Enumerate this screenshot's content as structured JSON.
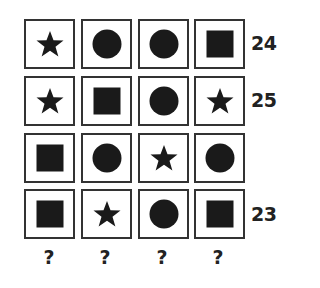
{
  "puzzle": {
    "grid": [
      [
        "star",
        "circle",
        "circle",
        "square"
      ],
      [
        "star",
        "square",
        "circle",
        "star"
      ],
      [
        "square",
        "circle",
        "star",
        "circle"
      ],
      [
        "square",
        "star",
        "circle",
        "square"
      ]
    ],
    "row_sums": [
      "24",
      "25",
      "",
      "23"
    ],
    "column_answers": [
      "?",
      "?",
      "?",
      "?"
    ]
  }
}
